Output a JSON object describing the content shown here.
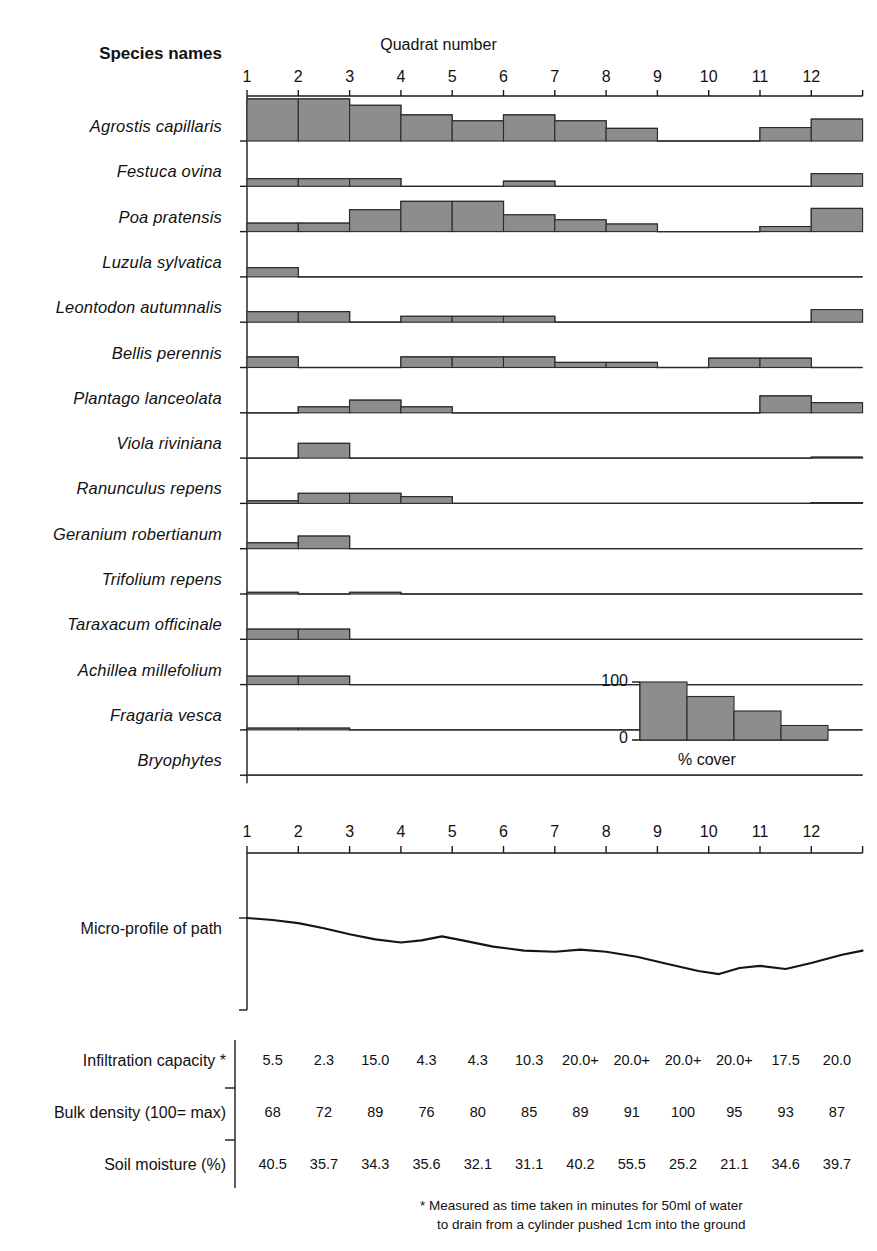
{
  "header": {
    "species_names_label": "Species names",
    "quadrat_number_label": "Quadrat number"
  },
  "quadrat_ticks": [
    "1",
    "2",
    "3",
    "4",
    "5",
    "6",
    "7",
    "8",
    "9",
    "10",
    "11",
    "12"
  ],
  "legend": {
    "top_value": "100",
    "bottom_value": "0",
    "caption": "% cover",
    "bars": [
      100,
      75,
      50,
      25
    ]
  },
  "micro_profile_label": "Micro-profile of path",
  "footnote_line1": "* Measured as time taken in minutes for 50ml of water",
  "footnote_line2": "to drain from a cylinder pushed 1cm into the ground",
  "colors": {
    "bar_fill": "#8d8d8d",
    "bar_stroke": "#2b2b2b",
    "axis": "#1a1a1a",
    "text": "#111111"
  },
  "chart_data": {
    "type": "bar",
    "xlabel": "Quadrat number",
    "ylabel": "% cover",
    "ylim": [
      0,
      100
    ],
    "grid": false,
    "legend_position": "inset-right",
    "categories": [
      "1",
      "2",
      "3",
      "4",
      "5",
      "6",
      "7",
      "8",
      "9",
      "10",
      "11",
      "12"
    ],
    "series": [
      {
        "name": "Agrostis capillaris",
        "values": [
          100,
          100,
          85,
          62,
          48,
          62,
          48,
          30,
          0,
          0,
          32,
          52
        ]
      },
      {
        "name": "Festuca ovina",
        "values": [
          18,
          18,
          18,
          0,
          0,
          12,
          0,
          0,
          0,
          0,
          0,
          30
        ]
      },
      {
        "name": "Poa pratensis",
        "values": [
          20,
          20,
          52,
          72,
          72,
          40,
          28,
          18,
          0,
          0,
          12,
          55
        ]
      },
      {
        "name": "Luzula sylvatica",
        "values": [
          22,
          0,
          0,
          0,
          0,
          0,
          0,
          0,
          0,
          0,
          0,
          0
        ]
      },
      {
        "name": "Leontodon autumnalis",
        "values": [
          25,
          25,
          0,
          14,
          14,
          14,
          0,
          0,
          0,
          0,
          0,
          30
        ]
      },
      {
        "name": "Bellis perennis",
        "values": [
          25,
          0,
          0,
          25,
          25,
          25,
          12,
          12,
          0,
          22,
          22,
          0
        ]
      },
      {
        "name": "Plantago lanceolata",
        "values": [
          0,
          14,
          30,
          14,
          0,
          0,
          0,
          0,
          0,
          0,
          40,
          24
        ]
      },
      {
        "name": "Viola riviniana",
        "values": [
          0,
          35,
          0,
          0,
          0,
          0,
          0,
          0,
          0,
          0,
          0,
          2
        ]
      },
      {
        "name": "Ranunculus repens",
        "values": [
          6,
          24,
          24,
          16,
          0,
          0,
          0,
          0,
          0,
          0,
          0,
          2
        ]
      },
      {
        "name": "Geranium robertianum",
        "values": [
          14,
          30,
          0,
          0,
          0,
          0,
          0,
          0,
          0,
          0,
          0,
          0
        ]
      },
      {
        "name": "Trifolium repens",
        "values": [
          4,
          0,
          4,
          0,
          0,
          0,
          0,
          0,
          0,
          0,
          0,
          0
        ]
      },
      {
        "name": "Taraxacum officinale",
        "values": [
          24,
          24,
          0,
          0,
          0,
          0,
          0,
          0,
          0,
          0,
          0,
          0
        ]
      },
      {
        "name": "Achillea millefolium",
        "values": [
          20,
          20,
          0,
          0,
          0,
          0,
          0,
          0,
          0,
          0,
          0,
          0
        ]
      },
      {
        "name": "Fragaria vesca",
        "values": [
          4,
          4,
          0,
          0,
          0,
          0,
          0,
          0,
          0,
          0,
          0,
          0
        ]
      },
      {
        "name": "Bryophytes",
        "values": [
          0,
          0,
          0,
          0,
          0,
          0,
          0,
          0,
          0,
          0,
          0,
          0
        ]
      }
    ],
    "micro_profile": {
      "type": "line",
      "label": "Micro-profile of path",
      "x": [
        0,
        0.5,
        1,
        1.5,
        2,
        2.5,
        3,
        3.4,
        3.8,
        4.2,
        4.8,
        5.4,
        6,
        6.5,
        7,
        7.6,
        8.2,
        8.8,
        9.2,
        9.6,
        10,
        10.5,
        11,
        11.6,
        12
      ],
      "y": [
        0,
        2,
        5,
        10,
        16,
        21,
        24,
        22,
        18,
        22,
        28,
        32,
        33,
        31,
        33,
        38,
        45,
        52,
        55,
        49,
        47,
        50,
        44,
        36,
        32
      ]
    },
    "measurement_rows": [
      {
        "label": "Infiltration capacity *",
        "values": [
          "5.5",
          "2.3",
          "15.0",
          "4.3",
          "4.3",
          "10.3",
          "20.0+",
          "20.0+",
          "20.0+",
          "20.0+",
          "17.5",
          "20.0"
        ]
      },
      {
        "label": "Bulk density (100= max)",
        "values": [
          "68",
          "72",
          "89",
          "76",
          "80",
          "85",
          "89",
          "91",
          "100",
          "95",
          "93",
          "87"
        ]
      },
      {
        "label": "Soil moisture (%)",
        "values": [
          "40.5",
          "35.7",
          "34.3",
          "35.6",
          "32.1",
          "31.1",
          "40.2",
          "55.5",
          "25.2",
          "21.1",
          "34.6",
          "39.7"
        ]
      }
    ]
  }
}
